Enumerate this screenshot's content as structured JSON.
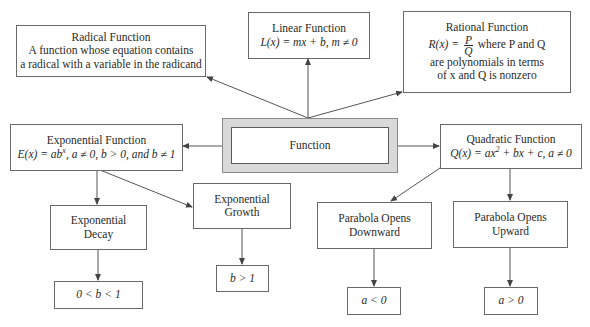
{
  "diagram": {
    "center": {
      "label": "Function"
    },
    "radical": {
      "title": "Radical Function",
      "line1": "A function whose equation contains",
      "line2": "a radical with a variable in the radicand"
    },
    "linear": {
      "title": "Linear Function",
      "formula": "L(x) = mx + b, m ≠ 0"
    },
    "rational": {
      "title": "Rational Function",
      "formula_lhs": "R(x) =",
      "frac_num": "P",
      "frac_den": "Q",
      "formula_rhs": "where P and Q",
      "line2": "are polynomials in terms",
      "line3": "of x and Q is nonzero"
    },
    "exponential": {
      "title": "Exponential Function",
      "formula_a": "E(x) = ab",
      "formula_sup": "x",
      "formula_b": ", a ≠ 0, b > 0, and b ≠ 1"
    },
    "quadratic": {
      "title": "Quadratic Function",
      "formula_a": "Q(x) =  ax",
      "formula_sup": "2",
      "formula_b": " + bx + c, a ≠ 0"
    },
    "exp_decay": {
      "line1": "Exponential",
      "line2": "Decay",
      "condition": "0 < b < 1"
    },
    "exp_growth": {
      "line1": "Exponential",
      "line2": "Growth",
      "condition": "b > 1"
    },
    "parabola_down": {
      "line1": "Parabola Opens",
      "line2": "Downward",
      "condition": "a < 0"
    },
    "parabola_up": {
      "line1": "Parabola Opens",
      "line2": "Upward",
      "condition": "a > 0"
    },
    "colors": {
      "line": "#555555",
      "box_border": "#6a6a6a",
      "center_fill": "#d9d9d9"
    }
  }
}
